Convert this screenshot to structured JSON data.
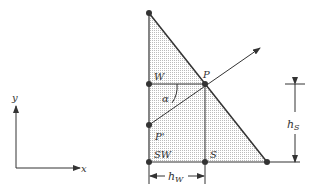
{
  "labels": {
    "x_axis": "x",
    "y_axis": "y",
    "W": "W",
    "P": "P",
    "alpha": "α",
    "P_prime": "P'",
    "SW": "SW",
    "S": "S",
    "h_w_main": "h",
    "h_w_sub": "W",
    "h_s_main": "h",
    "h_s_sub": "S"
  },
  "colors": {
    "stroke": "#333333",
    "fill": "#d9d9d9"
  }
}
